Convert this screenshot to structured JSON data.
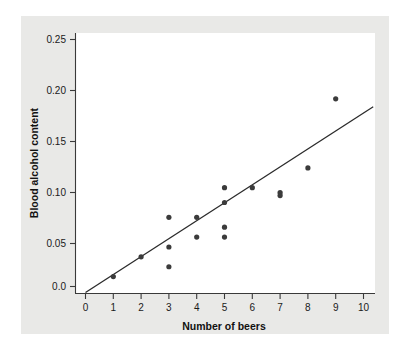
{
  "chart_data": {
    "type": "scatter",
    "title": "",
    "subtitle": "",
    "xlabel": "Number of beers",
    "ylabel": "Blood alcohol content",
    "xlim": [
      0,
      10.6
    ],
    "ylim": [
      -0.012,
      0.265
    ],
    "xticks": [
      0,
      1,
      2,
      3,
      4,
      5,
      6,
      7,
      8,
      9,
      10
    ],
    "xtick_labels": [
      "0",
      "1",
      "2",
      "3",
      "4",
      "5",
      "6",
      "7",
      "8",
      "9",
      "10"
    ],
    "yticks": [
      0.0,
      0.05,
      0.1,
      0.15,
      0.2,
      0.25
    ],
    "ytick_labels": [
      "0.0",
      "0.05",
      "0.10",
      "0.15",
      "0.20",
      "0.25"
    ],
    "grid": false,
    "legend": false,
    "legend_position": "none",
    "marker": "circle",
    "marker_color": "#3b3b3b",
    "marker_radius_px": 2.6,
    "points": [
      {
        "x": 1,
        "y": 0.01
      },
      {
        "x": 2,
        "y": 0.03
      },
      {
        "x": 3,
        "y": 0.07
      },
      {
        "x": 3,
        "y": 0.04
      },
      {
        "x": 3,
        "y": 0.02
      },
      {
        "x": 4,
        "y": 0.07
      },
      {
        "x": 4,
        "y": 0.05
      },
      {
        "x": 5,
        "y": 0.1
      },
      {
        "x": 5,
        "y": 0.085
      },
      {
        "x": 5,
        "y": 0.06
      },
      {
        "x": 5,
        "y": 0.05
      },
      {
        "x": 6,
        "y": 0.1
      },
      {
        "x": 7,
        "y": 0.095
      },
      {
        "x": 7,
        "y": 0.092
      },
      {
        "x": 8,
        "y": 0.12
      },
      {
        "x": 9,
        "y": 0.19
      }
    ],
    "fit_line": {
      "type": "linear-regression",
      "color": "#2b2b2b",
      "x_start": 0.0,
      "y_start": -0.006,
      "x_end": 10.35,
      "y_end": 0.182,
      "slope": 0.018,
      "intercept": -0.006
    }
  }
}
